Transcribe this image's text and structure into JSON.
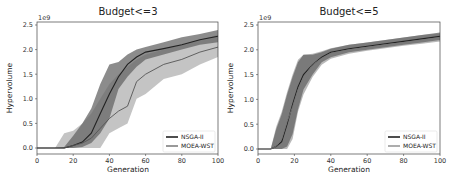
{
  "chart_data": [
    {
      "type": "line",
      "title": "Budget<=3",
      "xlabel": "Generation",
      "ylabel": "Hypervolume",
      "y_scale_label": "1e9",
      "xlim": [
        0,
        100
      ],
      "ylim": [
        -0.1,
        2.55
      ],
      "xticks": [
        0,
        20,
        40,
        60,
        80,
        100
      ],
      "yticks": [
        0.0,
        0.5,
        1.0,
        1.5,
        2.0,
        2.5
      ],
      "ytick_labels": [
        "0.0",
        "0.5",
        "1.0",
        "1.5",
        "2.0",
        "2.5"
      ],
      "grid": false,
      "legend_position": "lower right",
      "x": [
        0,
        10,
        15,
        20,
        25,
        30,
        35,
        40,
        45,
        50,
        55,
        60,
        70,
        80,
        90,
        100
      ],
      "series": [
        {
          "name": "NSGA-II",
          "color": "#222222",
          "band_color": "#666666",
          "values": [
            0,
            0,
            0,
            0.05,
            0.12,
            0.3,
            0.7,
            1.1,
            1.45,
            1.7,
            1.85,
            1.95,
            2.02,
            2.1,
            2.2,
            2.27
          ],
          "upper": [
            0,
            0,
            0.02,
            0.25,
            0.5,
            0.8,
            1.3,
            1.7,
            1.75,
            1.9,
            2.0,
            2.05,
            2.15,
            2.25,
            2.32,
            2.4
          ],
          "lower": [
            0,
            0,
            0,
            0,
            0.02,
            0.1,
            0.3,
            0.6,
            1.2,
            1.45,
            1.65,
            1.8,
            1.9,
            2.0,
            2.1,
            2.15
          ]
        },
        {
          "name": "MOEA-WST",
          "color": "#555555",
          "band_color": "#b5b5b5",
          "values": [
            0,
            0,
            0,
            0.05,
            0.1,
            0.2,
            0.4,
            0.6,
            0.75,
            0.85,
            1.35,
            1.5,
            1.7,
            1.8,
            1.95,
            2.05
          ],
          "upper": [
            0,
            0,
            0.3,
            0.35,
            0.5,
            0.7,
            1.0,
            1.3,
            1.5,
            1.65,
            1.8,
            1.9,
            2.0,
            2.1,
            2.2,
            2.3
          ],
          "lower": [
            0,
            0,
            0,
            0,
            0,
            0,
            0,
            0.3,
            0.4,
            0.5,
            1.0,
            1.1,
            1.4,
            1.5,
            1.7,
            1.85
          ]
        }
      ]
    },
    {
      "type": "line",
      "title": "Budget<=5",
      "xlabel": "Generation",
      "ylabel": "Hypervolume",
      "y_scale_label": "1e9",
      "xlim": [
        0,
        100
      ],
      "ylim": [
        -0.1,
        2.55
      ],
      "xticks": [
        0,
        20,
        40,
        60,
        80,
        100
      ],
      "yticks": [
        0.0,
        0.5,
        1.0,
        1.5,
        2.0,
        2.5
      ],
      "ytick_labels": [
        "0.0",
        "0.5",
        "1.0",
        "1.5",
        "2.0",
        "2.5"
      ],
      "grid": false,
      "legend_position": "lower right",
      "x": [
        0,
        7,
        10,
        13,
        16,
        19,
        22,
        25,
        30,
        35,
        40,
        50,
        60,
        70,
        80,
        90,
        100
      ],
      "series": [
        {
          "name": "NSGA-II",
          "color": "#222222",
          "band_color": "#666666",
          "values": [
            0,
            0,
            0.05,
            0.15,
            0.5,
            0.9,
            1.25,
            1.5,
            1.7,
            1.85,
            1.95,
            2.02,
            2.07,
            2.12,
            2.17,
            2.22,
            2.27
          ],
          "upper": [
            0,
            0,
            0.4,
            0.7,
            1.1,
            1.45,
            1.75,
            1.9,
            1.9,
            1.95,
            2.02,
            2.1,
            2.15,
            2.2,
            2.25,
            2.3,
            2.35
          ],
          "lower": [
            0,
            0,
            0,
            0,
            0.05,
            0.3,
            0.8,
            1.2,
            1.5,
            1.75,
            1.85,
            1.95,
            2.0,
            2.05,
            2.1,
            2.15,
            2.2
          ]
        },
        {
          "name": "MOEA-WST",
          "color": "#777777",
          "band_color": "#a8a8a8",
          "values": [
            0,
            0,
            0.05,
            0.2,
            0.55,
            0.85,
            1.2,
            1.45,
            1.7,
            1.83,
            1.93,
            2.0,
            2.05,
            2.1,
            2.15,
            2.2,
            2.25
          ],
          "upper": [
            0,
            0,
            0.45,
            0.75,
            1.15,
            1.5,
            1.8,
            1.9,
            1.92,
            1.97,
            2.03,
            2.1,
            2.15,
            2.2,
            2.25,
            2.3,
            2.33
          ],
          "lower": [
            0,
            0,
            0,
            0,
            0,
            0.2,
            0.75,
            1.1,
            1.45,
            1.7,
            1.82,
            1.92,
            1.98,
            2.03,
            2.08,
            2.12,
            2.17
          ]
        }
      ]
    }
  ],
  "charts_layout": [
    {
      "left": 37,
      "right": 218,
      "top": 22,
      "bottom": 154,
      "y0px": 148,
      "y25px": 25
    },
    {
      "left": 258,
      "right": 440,
      "top": 22,
      "bottom": 154,
      "y0px": 149,
      "y25px": 25
    }
  ]
}
